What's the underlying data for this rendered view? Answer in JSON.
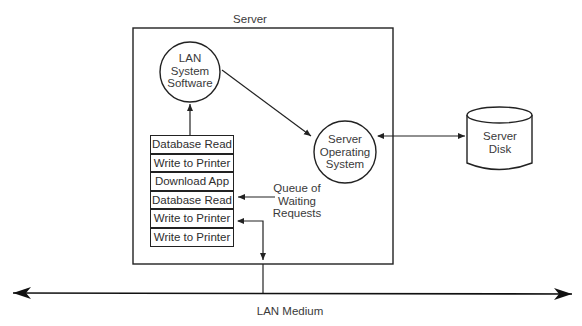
{
  "diagram": {
    "server_label": "Server",
    "lan_system_software": [
      "LAN",
      "System",
      "Software"
    ],
    "server_os": [
      "Server",
      "Operating",
      "System"
    ],
    "server_disk": [
      "Server",
      "Disk"
    ],
    "queue_label": [
      "Queue of",
      "Waiting",
      "Requests"
    ],
    "queue_items": [
      "Database Read",
      "Write to Printer",
      "Download App",
      "Database Read",
      "Write to Printer",
      "Write to Printer"
    ],
    "lan_medium_label": "LAN Medium",
    "colors": {
      "stroke": "#222222",
      "text": "#3a3a3a",
      "background": "#ffffff"
    }
  }
}
